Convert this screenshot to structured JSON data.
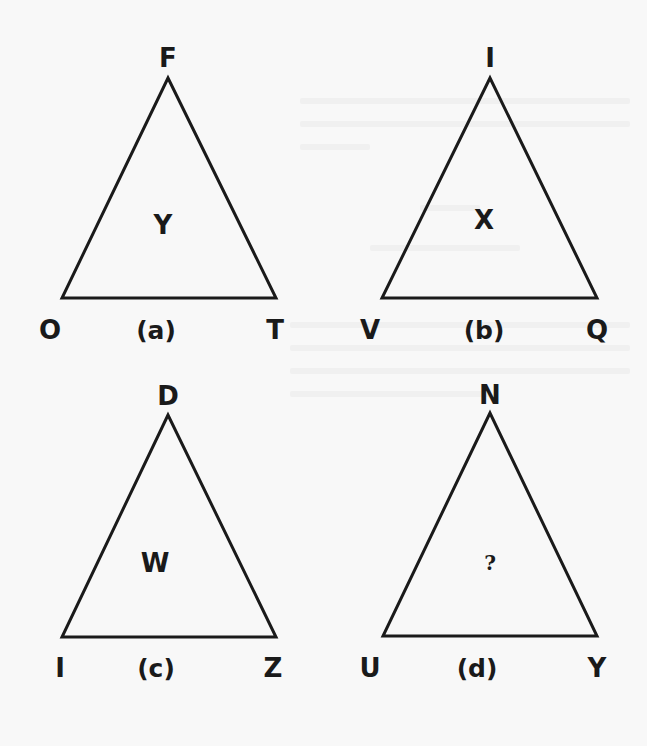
{
  "puzzle": {
    "description": "Letter triangle puzzle: find the missing center letter",
    "triangles": [
      {
        "id": "a",
        "caption": "(a)",
        "top": "F",
        "left": "O",
        "right": "T",
        "center": "Y",
        "geometry": {
          "apex": [
            168,
            78
          ],
          "base_left": [
            62,
            298
          ],
          "base_right": [
            276,
            298
          ]
        },
        "label_pos": {
          "top": [
            168,
            58
          ],
          "left": [
            50,
            330
          ],
          "right": [
            275,
            330
          ],
          "caption": [
            156,
            330
          ],
          "center": [
            163,
            225
          ]
        }
      },
      {
        "id": "b",
        "caption": "(b)",
        "top": "I",
        "left": "V",
        "right": "Q",
        "center": "X",
        "geometry": {
          "apex": [
            490,
            78
          ],
          "base_left": [
            382,
            298
          ],
          "base_right": [
            597,
            298
          ]
        },
        "label_pos": {
          "top": [
            490,
            58
          ],
          "left": [
            370,
            330
          ],
          "right": [
            597,
            330
          ],
          "caption": [
            484,
            330
          ],
          "center": [
            484,
            220
          ]
        }
      },
      {
        "id": "c",
        "caption": "(c)",
        "top": "D",
        "left": "I",
        "right": "Z",
        "center": "W",
        "geometry": {
          "apex": [
            168,
            415
          ],
          "base_left": [
            62,
            637
          ],
          "base_right": [
            276,
            637
          ]
        },
        "label_pos": {
          "top": [
            168,
            396
          ],
          "left": [
            60,
            668
          ],
          "right": [
            273,
            668
          ],
          "caption": [
            156,
            668
          ],
          "center": [
            155,
            563
          ]
        }
      },
      {
        "id": "d",
        "caption": "(d)",
        "top": "N",
        "left": "U",
        "right": "Y",
        "center": "?",
        "geometry": {
          "apex": [
            490,
            413
          ],
          "base_left": [
            383,
            636
          ],
          "base_right": [
            597,
            636
          ]
        },
        "label_pos": {
          "top": [
            490,
            395
          ],
          "left": [
            370,
            668
          ],
          "right": [
            597,
            668
          ],
          "caption": [
            477,
            668
          ],
          "center": [
            490,
            563
          ]
        }
      }
    ],
    "colors": {
      "ink": "#1a1a1a",
      "paper": "#f8f8f8"
    },
    "stroke_width": 3
  }
}
